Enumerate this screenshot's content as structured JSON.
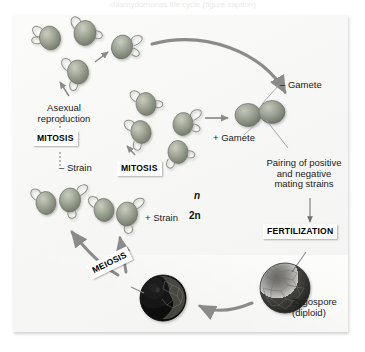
{
  "figure": {
    "title_cropped": "chlamydomonas life cycle (figure caption)",
    "organism_cells": "biflagellate oval cells"
  },
  "labels": {
    "asexual_line1": "Asexual",
    "asexual_line2": "reproduction",
    "mitosis_top": "MITOSIS",
    "mitosis_middle": "MITOSIS",
    "minus_strain": "– Strain",
    "plus_strain": "+ Strain",
    "minus_gamete": "– Gamete",
    "plus_gamete": "+ Gamete",
    "pairing_line1": "Pairing of positive",
    "pairing_line2": "and negative",
    "pairing_line3": "mating strains",
    "fertilization": "FERTILIZATION",
    "meiosis": "MEIOSIS",
    "zygospore_line1": "Zygospore",
    "zygospore_line2": "(diploid)",
    "haploid_n": "n",
    "diploid_2n": "2n"
  },
  "colors": {
    "panel_bg": "#f7f7f5",
    "arrow_gray": "#8b8b8b",
    "cell_body": "#9aa08f",
    "cell_outline": "#7d8274",
    "zygospore_dark": "#3a3a38",
    "germinating_black": "#0d0d0d",
    "text": "#1b1b1b",
    "label_box": "#ffffff"
  },
  "icons": {
    "cell": "flagellated-cell-icon",
    "zygospore": "zygospore-icon",
    "germinating": "germinating-zygospore-icon"
  }
}
